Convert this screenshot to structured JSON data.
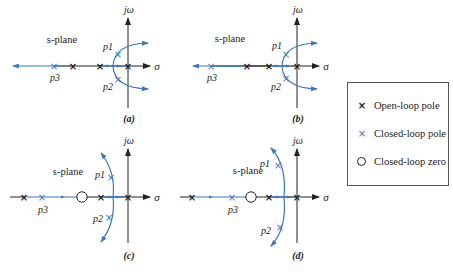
{
  "colors": {
    "axis": "#222222",
    "locus": "#3a78c2",
    "closed_pole": "#3a78c2",
    "open_pole": "#222222"
  },
  "axes": {
    "imag_label": "jω",
    "real_label": "σ",
    "plane_label": "s-plane"
  },
  "panels": [
    {
      "id": "a",
      "caption": "(a)",
      "p1": "p1",
      "p2": "p2",
      "p3": "p3",
      "description": "Three open-loop poles on real axis; closed-loop poles p1, p2 near imaginary axis, p3 far left; branches curve into right half-plane"
    },
    {
      "id": "b",
      "caption": "(b)",
      "p1": "p1",
      "p2": "p2",
      "p3": "p3",
      "description": "Same as (a) with p3 slightly closer to origin"
    },
    {
      "id": "c",
      "caption": "(c)",
      "p1": "p1",
      "p2": "p2",
      "p3": "p3",
      "description": "Added closed-loop zero; complex branches stay in left half-plane"
    },
    {
      "id": "d",
      "caption": "(d)",
      "p1": "p1",
      "p2": "p2",
      "p3": "p3",
      "description": "Zero with p3 near zero; complex branches farther left"
    }
  ],
  "legend": {
    "items": [
      {
        "symbol": "×",
        "label": "Open-loop pole"
      },
      {
        "symbol": "×",
        "label": "Closed-loop pole"
      },
      {
        "symbol": "○",
        "label": "Closed-loop zero"
      }
    ]
  }
}
